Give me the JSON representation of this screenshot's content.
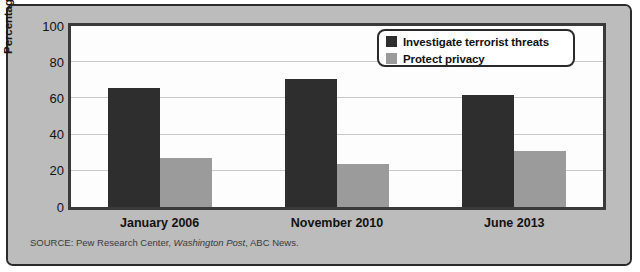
{
  "chart_data": {
    "type": "bar",
    "title": "",
    "xlabel": "",
    "ylabel": "Percentage of respondents",
    "ylim": [
      0,
      100
    ],
    "yticks": [
      0,
      20,
      40,
      60,
      80,
      100
    ],
    "grid": true,
    "legend_position": "top-right",
    "categories": [
      "January 2006",
      "November 2010",
      "June 2013"
    ],
    "series": [
      {
        "name": "Investigate terrorist threats",
        "color": "#2e2e2e",
        "values": [
          66,
          71,
          62
        ]
      },
      {
        "name": "Protect privacy",
        "color": "#9b9b9b",
        "values": [
          27,
          24,
          31
        ]
      }
    ],
    "source": {
      "prefix": "SOURCE: Pew Research Center, ",
      "italic": "Washington Post",
      "suffix": ", ABC News."
    }
  }
}
